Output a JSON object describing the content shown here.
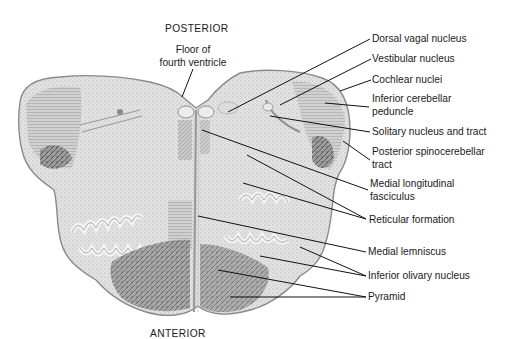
{
  "diagram": {
    "orientation": {
      "top": "POSTERIOR",
      "bottom": "ANTERIOR"
    },
    "colors": {
      "background": "#ffffff",
      "tissue_light": "#e4e4e4",
      "tissue_mid": "#bdbdbd",
      "tissue_dark": "#6e6e6e",
      "outline": "#8a8a8a",
      "leader_line": "#111111",
      "text": "#1a1a1a"
    },
    "labels": [
      {
        "id": "floor-fourth-ventricle",
        "lines": [
          "Floor of",
          "fourth ventricle"
        ],
        "side": "top"
      },
      {
        "id": "dorsal-vagal-nucleus",
        "lines": [
          "Dorsal vagal nucleus"
        ],
        "side": "right"
      },
      {
        "id": "vestibular-nucleus",
        "lines": [
          "Vestibular nucleus"
        ],
        "side": "right"
      },
      {
        "id": "cochlear-nuclei",
        "lines": [
          "Cochlear nuclei"
        ],
        "side": "right"
      },
      {
        "id": "inferior-cerebellar-peduncle",
        "lines": [
          "Inferior cerebellar",
          "peduncle"
        ],
        "side": "right"
      },
      {
        "id": "solitary-nucleus-tract",
        "lines": [
          "Solitary nucleus and tract"
        ],
        "side": "right"
      },
      {
        "id": "posterior-spinocerebellar-tract",
        "lines": [
          "Posterior spinocerebellar",
          "tract"
        ],
        "side": "right"
      },
      {
        "id": "medial-longitudinal-fasciculus",
        "lines": [
          "Medial longitudinal",
          "fasciculus"
        ],
        "side": "right"
      },
      {
        "id": "reticular-formation",
        "lines": [
          "Reticular formation"
        ],
        "side": "right"
      },
      {
        "id": "medial-lemniscus",
        "lines": [
          "Medial lemniscus"
        ],
        "side": "right"
      },
      {
        "id": "inferior-olivary-nucleus",
        "lines": [
          "Inferior olivary nucleus"
        ],
        "side": "right"
      },
      {
        "id": "pyramid",
        "lines": [
          "Pyramid"
        ],
        "side": "right"
      }
    ]
  }
}
